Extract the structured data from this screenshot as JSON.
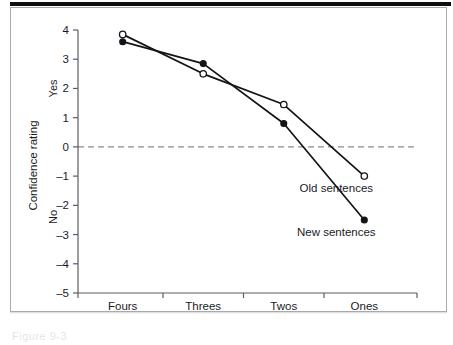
{
  "figure": {
    "caption_fragment": "Figure 9-3"
  },
  "chart_data": {
    "type": "line",
    "title": "",
    "subtitle": "",
    "xlabel": "",
    "ylabel": "Confidence rating",
    "categories": [
      "Fours",
      "Threes",
      "Twos",
      "Ones"
    ],
    "series": [
      {
        "name": "Old sentences",
        "marker": "open-circle",
        "values": [
          3.85,
          2.5,
          1.45,
          -1.0
        ]
      },
      {
        "name": "New sentences",
        "marker": "filled-circle",
        "values": [
          3.6,
          2.85,
          0.8,
          -2.5
        ]
      }
    ],
    "ylim": [
      -5,
      4
    ],
    "yticks": [
      4,
      3,
      2,
      1,
      0,
      -1,
      -2,
      -3,
      -4,
      -5
    ],
    "ytick_labels": [
      "4",
      "3",
      "2",
      "1",
      "0",
      "-1",
      "-2",
      "-3",
      "-4",
      "-5"
    ],
    "grid": false,
    "legend_position": "inline-right-of-endpoints",
    "annotations": [
      {
        "text": "Yes",
        "axis": "y",
        "value": 2.0,
        "rotated": true
      },
      {
        "text": "No",
        "axis": "y",
        "value": -2.4,
        "rotated": true
      }
    ],
    "reference_lines": [
      {
        "axis": "y",
        "value": 0,
        "style": "dashed",
        "color": "#8c8c92"
      }
    ],
    "colors": {
      "line": "#141418",
      "marker_fill_open": "#ffffff",
      "marker_fill_closed": "#141418",
      "axis": "#5c5c63",
      "zero_line": "#8c8c92",
      "frame": "#a9a9ad",
      "top_rule": "#100f10"
    }
  }
}
